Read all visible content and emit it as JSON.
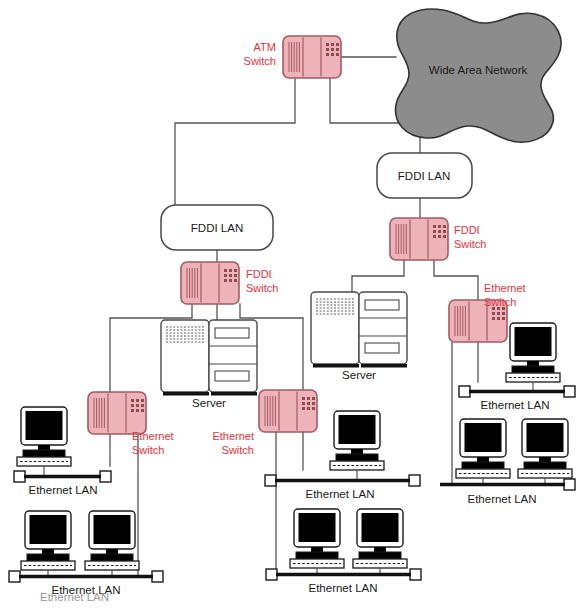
{
  "diagram": {
    "colors": {
      "switch_fill": "#eeb3b8",
      "switch_fill_light": "#f2c0c4",
      "switch_stroke": "#a35a63",
      "switch_label": "#e8343c",
      "wan_fill": "#8c8c8c",
      "wan_stroke": "#333333",
      "line": "#555555",
      "bus": "#111111",
      "text": "#1a1a1a",
      "screen": "#000000",
      "background": "#ffffff"
    },
    "wan": {
      "label": "Wide Area Network",
      "shape": "cloud-bone"
    },
    "atm_switch": {
      "label": "ATM\nSwitch",
      "label_line1": "ATM",
      "label_line2": "Switch"
    },
    "fddi_lans": [
      {
        "id": "fddi-lan-left",
        "label": "FDDI LAN"
      },
      {
        "id": "fddi-lan-right",
        "label": "FDDI LAN"
      }
    ],
    "fddi_switches": [
      {
        "id": "fddi-switch-left",
        "label_line1": "FDDI",
        "label_line2": "Switch"
      },
      {
        "id": "fddi-switch-right",
        "label_line1": "FDDI",
        "label_line2": "Switch"
      }
    ],
    "ethernet_switches": [
      {
        "id": "ethernet-switch-1",
        "label_line1": "Ethernet",
        "label_line2": "Switch"
      },
      {
        "id": "ethernet-switch-2",
        "label_line1": "Ethernet",
        "label_line2": "Switch"
      },
      {
        "id": "ethernet-switch-3",
        "label_line1": "Ethernet",
        "label_line2": "Switch"
      }
    ],
    "servers": [
      {
        "id": "server-left",
        "label": "Server"
      },
      {
        "id": "server-right",
        "label": "Server"
      }
    ],
    "ethernet_lans": [
      {
        "id": "ethernet-lan-1",
        "label": "Ethernet LAN",
        "workstations": 1
      },
      {
        "id": "ethernet-lan-2",
        "label": "Ethernet LAN",
        "workstations": 2
      },
      {
        "id": "ethernet-lan-3",
        "label": "Ethernet LAN",
        "workstations": 1
      },
      {
        "id": "ethernet-lan-4",
        "label": "Ethernet LAN",
        "workstations": 2
      },
      {
        "id": "ethernet-lan-5",
        "label": "Ethernet LAN",
        "workstations": 1
      },
      {
        "id": "ethernet-lan-6",
        "label": "Ethernet LAN",
        "workstations": 2
      }
    ],
    "caption": "Ethernet LAN"
  }
}
